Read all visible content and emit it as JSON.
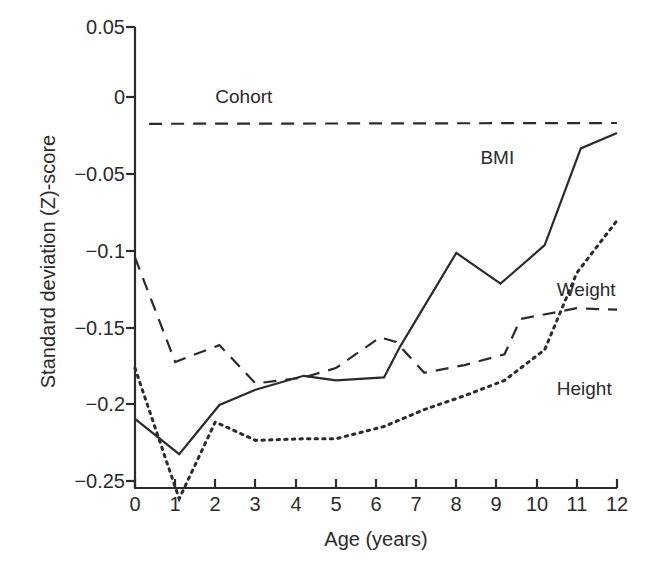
{
  "chart_data": {
    "type": "line",
    "title": "",
    "xlabel": "Age (years)",
    "ylabel": "Standard deviation (Z)-score",
    "xlim": [
      0,
      12
    ],
    "ylim": [
      -0.25,
      0.05
    ],
    "grid": false,
    "legend_position": "inline-annotations",
    "x_ticks": [
      "0",
      "1",
      "2",
      "3",
      "4",
      "5",
      "6",
      "7",
      "8",
      "9",
      "10",
      "11",
      "12"
    ],
    "y_ticks": [
      "0.05",
      "0",
      "−0.05",
      "−0.1",
      "−0.15",
      "−0.2",
      "−0.25"
    ],
    "series": [
      {
        "name": "Cohort",
        "style": "long-dashed",
        "color": "#2b2b2b",
        "label_x": 2.0,
        "label_y": 0.004,
        "x": [
          0.35,
          12.0
        ],
        "values": [
          -0.013,
          -0.0125
        ]
      },
      {
        "name": "Height",
        "style": "dashed",
        "color": "#2b2b2b",
        "label_x": 10.5,
        "label_y": -0.186,
        "x": [
          0.0,
          1.0,
          1.5,
          2.1,
          3.0,
          4.2,
          5.0,
          6.1,
          6.5,
          7.2,
          8.2,
          9.2,
          9.6,
          11.0,
          12.0
        ],
        "values": [
          -0.1,
          -0.168,
          -0.163,
          -0.157,
          -0.182,
          -0.178,
          -0.172,
          -0.152,
          -0.155,
          -0.175,
          -0.17,
          -0.163,
          -0.14,
          -0.133,
          -0.134
        ]
      },
      {
        "name": "Weight",
        "style": "dotted",
        "color": "#2b2b2b",
        "label_x": 10.5,
        "label_y": -0.122,
        "x": [
          0.0,
          1.1,
          2.0,
          3.0,
          4.2,
          5.0,
          6.2,
          7.2,
          8.2,
          9.2,
          10.2,
          11.0,
          12.0
        ],
        "values": [
          -0.172,
          -0.257,
          -0.207,
          -0.219,
          -0.218,
          -0.218,
          -0.21,
          -0.199,
          -0.19,
          -0.18,
          -0.16,
          -0.11,
          -0.076
        ]
      },
      {
        "name": "BMI",
        "style": "solid",
        "color": "#2b2b2b",
        "label_x": 8.6,
        "label_y": -0.036,
        "x": [
          0.0,
          1.1,
          2.1,
          3.0,
          4.2,
          5.0,
          6.2,
          6.6,
          8.0,
          9.1,
          10.2,
          11.1,
          12.0
        ],
        "values": [
          -0.205,
          -0.228,
          -0.196,
          -0.186,
          -0.177,
          -0.18,
          -0.178,
          -0.158,
          -0.097,
          -0.117,
          -0.092,
          -0.029,
          -0.019
        ]
      }
    ]
  },
  "axis": {
    "x_axis_name": "x-axis",
    "y_axis_name": "y-axis"
  }
}
